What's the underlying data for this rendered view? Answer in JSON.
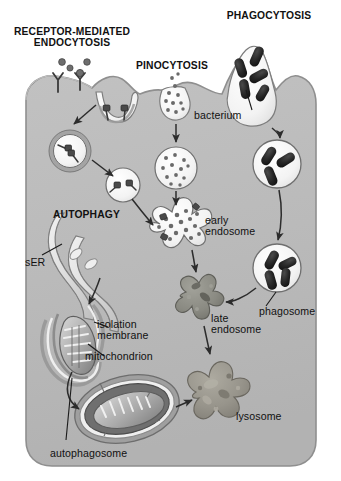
{
  "figure": {
    "title_headings": [
      {
        "id": "receptor-mediated-endocytosis",
        "text": "RECEPTOR-MEDIATED\nENDOCYTOSIS",
        "x": 12,
        "y": 26,
        "width": 120,
        "align": "center"
      },
      {
        "id": "pinocytosis",
        "text": "PINOCYTOSIS",
        "x": 131,
        "y": 60,
        "width": 82,
        "align": "center"
      },
      {
        "id": "phagocytosis",
        "text": "PHAGOCYTOSIS",
        "x": 220,
        "y": 10,
        "width": 98,
        "align": "center"
      },
      {
        "id": "autophagy",
        "text": "AUTOPHAGY",
        "x": 53,
        "y": 209,
        "width": 80,
        "align": "left"
      }
    ],
    "part_labels": [
      {
        "id": "bacterium",
        "text": "bacterium",
        "x": 194,
        "y": 110,
        "width": 60,
        "align": "left"
      },
      {
        "id": "early-endosome",
        "text": "early\nendosome",
        "x": 205,
        "y": 215,
        "width": 64,
        "align": "left"
      },
      {
        "id": "phagosome",
        "text": "phagosome",
        "x": 259,
        "y": 306,
        "width": 66,
        "align": "left"
      },
      {
        "id": "late-endosome",
        "text": "late\nendosome",
        "x": 211,
        "y": 313,
        "width": 64,
        "align": "left"
      },
      {
        "id": "lysosome",
        "text": "lysosome",
        "x": 236,
        "y": 411,
        "width": 58,
        "align": "left"
      },
      {
        "id": "ser",
        "text": "sER",
        "x": 25,
        "y": 257,
        "width": 28,
        "align": "left"
      },
      {
        "id": "isolation-membrane",
        "text": "isolation\nmembrane",
        "x": 97,
        "y": 319,
        "width": 62,
        "align": "left"
      },
      {
        "id": "mitochondrion",
        "text": "mitochondrion",
        "x": 85,
        "y": 351,
        "width": 82,
        "align": "left"
      },
      {
        "id": "autophagosome",
        "text": "autophagosome",
        "x": 50,
        "y": 448,
        "width": 92,
        "align": "left"
      }
    ],
    "colors": {
      "page_background": "#ffffff",
      "cytoplasm": "#b9b9b9",
      "cytoplasm_edge": "#8f8f8f",
      "vesicle_lumen": "#f4f4f4",
      "vesicle_outline": "#555555",
      "coat_ring": "#9a9a9a",
      "bacterium": "#2a2a2a",
      "cargo_dot": "#6e6e6e",
      "receptor_stem": "#3a3a3a",
      "late_endosome": "#8a8a84",
      "lysosome": "#9a978e",
      "organelle_light": "#e6e6e6",
      "organelle_mid": "#a8a8a8",
      "organelle_dark": "#6a6a6a",
      "arrow": "#2c2c2c",
      "leader_line": "#1a1a1a",
      "text": "#111111"
    },
    "structures": [
      {
        "id": "cell-body",
        "kind": "cytoplasm",
        "description": "rounded cell body filling most of frame"
      },
      {
        "id": "receptor-coated-pit",
        "kind": "membrane-invagination",
        "receptors": 2
      },
      {
        "id": "receptor-free-ligands",
        "kind": "ligand-dots",
        "count": 3
      },
      {
        "id": "surface-receptors",
        "kind": "y-receptor",
        "count": 2
      },
      {
        "id": "coated-vesicle",
        "kind": "vesicle",
        "coated": true,
        "cargo_receptors": 2
      },
      {
        "id": "uncoated-vesicle",
        "kind": "vesicle",
        "coated": false,
        "cargo_receptors": 2
      },
      {
        "id": "pinocytic-pit",
        "kind": "membrane-invagination",
        "cargo_dots": 11
      },
      {
        "id": "pinocytic-vesicle",
        "kind": "vesicle",
        "cargo_dots": 12
      },
      {
        "id": "phagocytic-cup",
        "kind": "membrane-cup",
        "bacteria": 5
      },
      {
        "id": "phagosome-upper",
        "kind": "vesicle",
        "bacteria": 3
      },
      {
        "id": "phagosome-lower",
        "kind": "vesicle",
        "bacteria": 3
      },
      {
        "id": "early-endosome-body",
        "kind": "tubulo-vesicular",
        "cargo_dots": 14
      },
      {
        "id": "late-endosome-body",
        "kind": "dense-blob"
      },
      {
        "id": "lysosome-body",
        "kind": "dense-blob"
      },
      {
        "id": "ser-cisternae",
        "kind": "smooth-er"
      },
      {
        "id": "isolation-membrane-body",
        "kind": "double-membrane-cup"
      },
      {
        "id": "mitochondrion-body",
        "kind": "mitochondrion"
      },
      {
        "id": "autophagosome-body",
        "kind": "double-membrane-vesicle",
        "contains": "mitochondrion"
      }
    ],
    "arrows": [
      {
        "id": "arrow-pit-to-coated-vesicle",
        "from": "receptor-coated-pit",
        "to": "coated-vesicle"
      },
      {
        "id": "arrow-coated-to-uncoated",
        "from": "coated-vesicle",
        "to": "uncoated-vesicle"
      },
      {
        "id": "arrow-uncoated-to-early-endosome",
        "from": "uncoated-vesicle",
        "to": "early-endosome-body"
      },
      {
        "id": "arrow-pinocytic-pit-to-vesicle",
        "from": "pinocytic-pit",
        "to": "pinocytic-vesicle"
      },
      {
        "id": "arrow-pinocytic-vesicle-to-early-endosome",
        "from": "pinocytic-vesicle",
        "to": "early-endosome-body"
      },
      {
        "id": "arrow-cup-to-phagosome",
        "from": "phagocytic-cup",
        "to": "phagosome-upper"
      },
      {
        "id": "arrow-phagosome-to-phagosome",
        "from": "phagosome-upper",
        "to": "phagosome-lower"
      },
      {
        "id": "arrow-phagosome-to-late-endosome",
        "from": "phagosome-lower",
        "to": "late-endosome-body"
      },
      {
        "id": "arrow-early-to-late-endosome",
        "from": "early-endosome-body",
        "to": "late-endosome-body"
      },
      {
        "id": "arrow-late-endosome-to-lysosome",
        "from": "late-endosome-body",
        "to": "lysosome-body"
      },
      {
        "id": "arrow-ser-to-isolation-membrane",
        "from": "ser-cisternae",
        "to": "isolation-membrane-body"
      },
      {
        "id": "arrow-isolation-to-autophagosome",
        "from": "isolation-membrane-body",
        "to": "autophagosome-body"
      },
      {
        "id": "arrow-autophagosome-to-lysosome",
        "from": "autophagosome-body",
        "to": "lysosome-body"
      }
    ],
    "leader_lines": [
      {
        "id": "leader-bacterium",
        "label": "bacterium"
      },
      {
        "id": "leader-phagosome",
        "label": "phagosome"
      },
      {
        "id": "leader-ser",
        "label": "sER"
      },
      {
        "id": "leader-isolation-membrane",
        "label": "isolation membrane"
      },
      {
        "id": "leader-mitochondrion",
        "label": "mitochondrion"
      },
      {
        "id": "leader-autophagosome",
        "label": "autophagosome"
      }
    ]
  }
}
